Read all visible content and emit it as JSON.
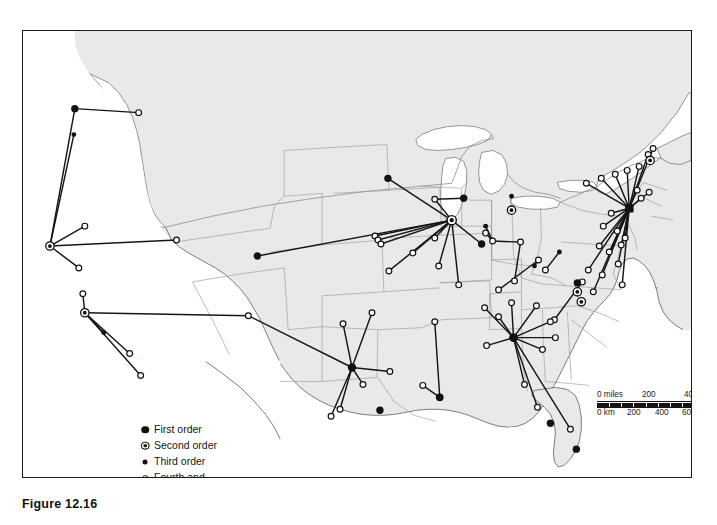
{
  "caption": "Figure 12.16",
  "legend": {
    "title": "",
    "items": [
      {
        "symbol": "first-order-marker",
        "label": "First order"
      },
      {
        "symbol": "second-order-marker",
        "label": "Second order"
      },
      {
        "symbol": "third-order-marker",
        "label": "Third order"
      },
      {
        "symbol": "fourth-order-marker",
        "label": "Fourth and\nfifth orders"
      }
    ]
  },
  "scale_bar": {
    "miles": {
      "unit_label": "0 miles",
      "ticks": [
        "200",
        "400"
      ],
      "max": 400
    },
    "km": {
      "unit_label": "0 km",
      "ticks": [
        "200",
        "400",
        "600"
      ],
      "max": 600
    }
  },
  "colors": {
    "land": "#e9e9e9",
    "water": "#ffffff",
    "border_internal": "#9a9a9a",
    "coast": "#5d5d5d",
    "frame": "#1b1b1b",
    "link": "#161616",
    "marker": "#111111"
  },
  "map": {
    "projection_note": "conterminous United States",
    "land_outline": "M 104,33 L 120,30 L 140,30 L 176,30 L 215,30 L 260,31 L 310,31 L 360,31 L 410,32 L 455,33 L 500,34 L 545,35 L 590,36 L 625,38 L 650,40 L 666,45 L 668,58 L 664,70 L 655,78 L 648,86 L 640,96 L 634,104 L 630,112 L 627,122 L 624,131 L 620,141 L 617,150 L 614,160 L 612,170 L 611,180 L 612,190 L 615,198 L 618,206 L 619,216 L 616,226 L 611,234 L 606,242 L 601,250 L 596,258 L 592,266 L 589,275 L 587,284 L 585,294 L 582,303 L 577,312 L 571,320 L 565,327 L 558,333 L 550,339 L 543,346 L 538,354 L 535,363 L 533,373 L 530,382 L 525,390 L 518,396 L 510,401 L 500,404 L 488,405 L 475,404 L 462,402 L 450,399 L 438,396 L 425,393 L 412,391 L 398,390 L 384,390 L 370,391 L 356,392 L 342,393 L 328,393 L 314,392 L 300,390 L 286,387 L 272,383 L 258,378 L 245,372 L 233,365 L 222,357 L 212,348 L 203,338 L 195,327 L 188,316 L 182,304 L 177,292 L 172,280 L 167,268 L 162,256 L 156,244 L 150,233 L 143,223 L 136,214 L 128,206 L 120,199 L 112,193 L 105,186 L 99,178 L 95,169 L 93,159 L 92,148 L 93,137 L 95,126 L 98,115 L 101,104 L 103,93 L 104,82 L 104,70 L 104,58 L 104,45 Z",
    "flows": [
      {
        "hub": "seattle",
        "hub_order": "first",
        "hub_xy": [
          74,
          108
        ],
        "spokes": [
          [
            138,
            112
          ]
        ]
      },
      {
        "hub": "portland",
        "hub_order": "third",
        "hub_xy": [
          73,
          134
        ],
        "spokes": []
      },
      {
        "hub": "san-francisco",
        "hub_order": "second",
        "hub_xy": [
          49,
          246
        ],
        "spokes": [
          [
            74,
            108
          ],
          [
            73,
            134
          ],
          [
            78,
            268
          ],
          [
            176,
            240
          ]
        ]
      },
      {
        "hub": "los-angeles",
        "hub_order": "second",
        "hub_xy": [
          84,
          313
        ],
        "spokes": [
          [
            82,
            294
          ],
          [
            103,
            333
          ],
          [
            129,
            354
          ],
          [
            140,
            376
          ],
          [
            248,
            316
          ]
        ]
      },
      {
        "hub": "denver",
        "hub_order": "first",
        "hub_xy": [
          257,
          256
        ],
        "spokes": [
          [
            452,
            220
          ]
        ]
      },
      {
        "hub": "minneapolis",
        "hub_order": "first",
        "hub_xy": [
          388,
          178
        ],
        "spokes": [
          [
            452,
            220
          ]
        ]
      },
      {
        "hub": "chicago",
        "hub_order": "second",
        "hub_xy": [
          452,
          220
        ],
        "spokes": [
          [
            388,
            178
          ],
          [
            435,
            199
          ],
          [
            464,
            198
          ],
          [
            257,
            256
          ],
          [
            375,
            236
          ],
          [
            389,
            271
          ],
          [
            413,
            253
          ],
          [
            435,
            238
          ],
          [
            439,
            266
          ],
          [
            482,
            244
          ],
          [
            459,
            285
          ],
          [
            490,
            226
          ]
        ]
      },
      {
        "hub": "detroit",
        "hub_order": "third",
        "hub_xy": [
          512,
          196
        ],
        "spokes": []
      },
      {
        "hub": "cleveland",
        "hub_order": "third",
        "hub_xy": [
          534,
          225
        ],
        "spokes": [
          [
            493,
            241
          ],
          [
            497,
            249
          ]
        ]
      },
      {
        "hub": "cincinnati",
        "hub_order": "fourth",
        "hub_xy": [
          499,
          281
        ],
        "spokes": [
          [
            521,
            256
          ]
        ]
      },
      {
        "hub": "new-york",
        "hub_order": "first",
        "hub_xy": [
          630,
          208
        ],
        "spokes": [
          [
            590,
            186
          ],
          [
            603,
            180
          ],
          [
            617,
            176
          ],
          [
            629,
            171
          ],
          [
            640,
            166
          ],
          [
            648,
            155
          ],
          [
            654,
            148
          ],
          [
            637,
            190
          ],
          [
            641,
            198
          ],
          [
            649,
            191
          ],
          [
            612,
            213
          ],
          [
            604,
            225
          ],
          [
            618,
            230
          ],
          [
            600,
            245
          ],
          [
            610,
            251
          ],
          [
            619,
            263
          ],
          [
            603,
            274
          ],
          [
            623,
            284
          ],
          [
            589,
            269
          ],
          [
            594,
            290
          ]
        ]
      },
      {
        "hub": "philadelphia",
        "hub_order": "second",
        "hub_xy": [
          613,
          258
        ],
        "spokes": []
      },
      {
        "hub": "baltimore",
        "hub_order": "third",
        "hub_xy": [
          608,
          245
        ],
        "spokes": []
      },
      {
        "hub": "dallas",
        "hub_order": "first",
        "hub_xy": [
          352,
          368
        ],
        "spokes": [
          [
            343,
            324
          ],
          [
            372,
            313
          ],
          [
            340,
            410
          ],
          [
            363,
            385
          ],
          [
            248,
            316
          ],
          [
            390,
            372
          ],
          [
            331,
            417
          ]
        ]
      },
      {
        "hub": "new-orleans",
        "hub_order": "first",
        "hub_xy": [
          440,
          398
        ],
        "spokes": [
          [
            435,
            322
          ],
          [
            423,
            386
          ]
        ]
      },
      {
        "hub": "atlanta",
        "hub_order": "first",
        "hub_xy": [
          514,
          338
        ],
        "spokes": [
          [
            485,
            308
          ],
          [
            499,
            317
          ],
          [
            512,
            303
          ],
          [
            537,
            306
          ],
          [
            551,
            322
          ],
          [
            556,
            338
          ],
          [
            543,
            350
          ],
          [
            487,
            346
          ],
          [
            525,
            385
          ],
          [
            538,
            408
          ],
          [
            571,
            430
          ]
        ]
      },
      {
        "hub": "tampa",
        "hub_order": "first",
        "hub_xy": [
          551,
          424
        ],
        "spokes": []
      },
      {
        "hub": "miami",
        "hub_order": "first",
        "hub_xy": [
          577,
          450
        ],
        "spokes": []
      },
      {
        "hub": "houston",
        "hub_order": "first",
        "hub_xy": [
          380,
          411
        ],
        "spokes": []
      },
      {
        "hub": "phoenix",
        "hub_order": "first",
        "hub_xy": [
          103,
          333
        ],
        "spokes": []
      },
      {
        "hub": "memphis",
        "hub_order": "fourth",
        "hub_xy": [
          459,
          285
        ],
        "spokes": []
      },
      {
        "hub": "boston-area",
        "hub_order": "second",
        "hub_xy": [
          652,
          178
        ],
        "spokes": []
      },
      {
        "hub": "norfolk",
        "hub_order": "second",
        "hub_xy": [
          600,
          275
        ],
        "spokes": []
      },
      {
        "hub": "pittsburgh",
        "hub_order": "first",
        "hub_xy": [
          578,
          253
        ],
        "spokes": []
      }
    ]
  }
}
